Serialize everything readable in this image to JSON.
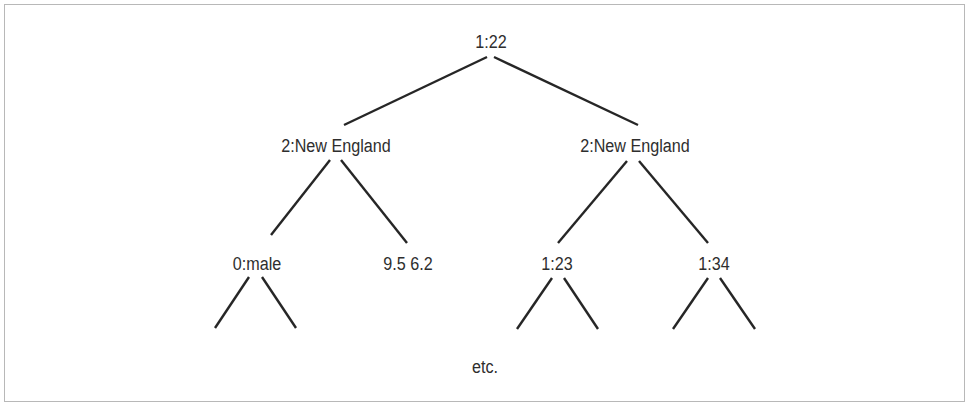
{
  "diagram": {
    "type": "tree",
    "nodes": {
      "root": {
        "label": "1:22"
      },
      "left_child": {
        "label": "2:New England"
      },
      "right_child": {
        "label": "2:New England"
      },
      "left_left": {
        "label": "0:male"
      },
      "left_right_leaf": {
        "label": "9.5 6.2"
      },
      "right_left": {
        "label": "1:23"
      },
      "right_right": {
        "label": "1:34"
      }
    },
    "edges": [
      [
        "root",
        "left_child"
      ],
      [
        "root",
        "right_child"
      ],
      [
        "left_child",
        "left_left"
      ],
      [
        "left_child",
        "left_right_leaf"
      ],
      [
        "right_child",
        "right_left"
      ],
      [
        "right_child",
        "right_right"
      ],
      [
        "left_left",
        "continuation"
      ],
      [
        "left_left",
        "continuation"
      ],
      [
        "right_left",
        "continuation"
      ],
      [
        "right_left",
        "continuation"
      ],
      [
        "right_right",
        "continuation"
      ],
      [
        "right_right",
        "continuation"
      ]
    ],
    "footer_note": "etc."
  }
}
